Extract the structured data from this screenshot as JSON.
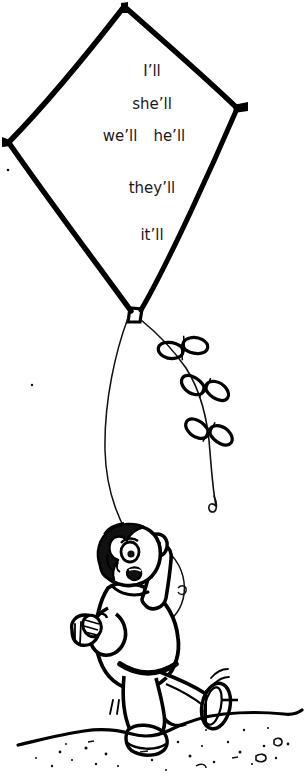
{
  "illustration": {
    "title": "Boy flying a kite",
    "description": "Line-art drawing of a smiling boy running while flying a diamond kite with a bowed tail",
    "ink_color": "#000000",
    "background_color": "#ffffff",
    "text_color": "#1a1a1a"
  },
  "kite": {
    "shape": "diamond",
    "words": [
      {
        "id": "line1",
        "text": "I’ll"
      },
      {
        "id": "line2",
        "text": "she’ll"
      },
      {
        "id": "line3a",
        "text": "we’ll"
      },
      {
        "id": "line3b",
        "text": "he’ll"
      },
      {
        "id": "line4",
        "text": "they’ll"
      },
      {
        "id": "line5",
        "text": "it’ll"
      }
    ],
    "tail": {
      "bow_count": 3
    }
  },
  "figure": {
    "name": "boy",
    "pose": "running with raised arm holding kite string"
  },
  "ground": {
    "name": "ground-line",
    "pebble_marks": true
  }
}
